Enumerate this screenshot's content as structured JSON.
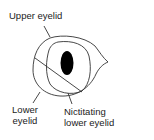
{
  "diagram": {
    "labels": {
      "upper_eyelid": "Upper eyelid",
      "lower_eyelid_line1": "Lower",
      "lower_eyelid_line2": "eyelid",
      "nictitating_line1": "Nictitating",
      "nictitating_line2": "lower eyelid"
    },
    "colors": {
      "stroke": "#333333",
      "pupil": "#000000",
      "background": "#ffffff",
      "text": "#222222"
    }
  }
}
